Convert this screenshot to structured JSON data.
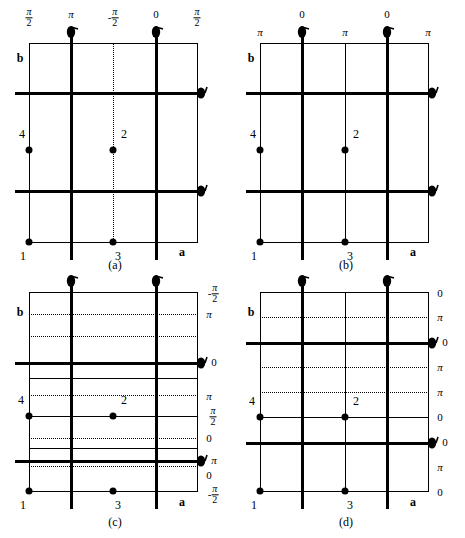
{
  "figure": {
    "type": "crystallographic-space-group-diagram",
    "panels": [
      {
        "id": "a",
        "caption": "(a)",
        "axis_a_label": "a",
        "axis_b_label": "b",
        "top_labels": [
          "π/2",
          "π",
          "-π/2",
          "0",
          "π/2"
        ],
        "top_labels_parts": [
          {
            "neg": "",
            "num": "π",
            "den": "2"
          },
          {
            "whole": "π"
          },
          {
            "neg": "-",
            "num": "π",
            "den": "2"
          },
          {
            "whole": "0"
          },
          {
            "neg": "",
            "num": "π",
            "den": "2"
          }
        ],
        "right_labels": [],
        "atoms": [
          {
            "label": "4",
            "x": 0.0,
            "y": 0.42
          },
          {
            "label": "2",
            "x": 0.5,
            "y": 0.42
          },
          {
            "label": "1",
            "x": 0.0,
            "y": 0.0
          },
          {
            "label": "3",
            "x": 0.5,
            "y": 0.0
          }
        ],
        "horizontal_dotted": [],
        "screw_axes_top": [
          1,
          3
        ],
        "screw_axes_right": [
          2,
          2
        ]
      },
      {
        "id": "b",
        "caption": "(b)",
        "axis_a_label": "a",
        "axis_b_label": "b",
        "top_labels": [
          "π",
          "0",
          "π",
          "0",
          "π"
        ],
        "top_labels_parts": [
          {
            "whole": "π"
          },
          {
            "whole": "0"
          },
          {
            "whole": "π"
          },
          {
            "whole": "0"
          },
          {
            "whole": "π"
          }
        ],
        "right_labels": [],
        "atoms": [
          {
            "label": "4",
            "x": 0.0,
            "y": 0.42
          },
          {
            "label": "2",
            "x": 0.5,
            "y": 0.42
          },
          {
            "label": "1",
            "x": 0.0,
            "y": 0.0
          },
          {
            "label": "3",
            "x": 0.5,
            "y": 0.0
          }
        ],
        "horizontal_dotted": [],
        "screw_axes_top": [
          1,
          3
        ],
        "screw_axes_right": [
          2,
          2
        ]
      },
      {
        "id": "c",
        "caption": "(c)",
        "axis_a_label": "a",
        "axis_b_label": "b",
        "top_labels": [],
        "right_labels": [
          "-π/2",
          "π",
          "0",
          "π",
          "π/2",
          "0",
          "π",
          "0",
          "-π/2"
        ],
        "right_labels_parts": [
          {
            "neg": "-",
            "num": "π",
            "den": "2"
          },
          {
            "whole": "π"
          },
          {
            "whole": "0"
          },
          {
            "whole": "π"
          },
          {
            "neg": "",
            "num": "π",
            "den": "2"
          },
          {
            "whole": "0"
          },
          {
            "whole": "π"
          },
          {
            "whole": "0"
          },
          {
            "neg": "-",
            "num": "π",
            "den": "2"
          }
        ],
        "atoms": [
          {
            "label": "4",
            "x": 0.0,
            "y": 0.42
          },
          {
            "label": "2",
            "x": 0.5,
            "y": 0.42
          },
          {
            "label": "1",
            "x": 0.0,
            "y": 0.0
          },
          {
            "label": "3",
            "x": 0.5,
            "y": 0.0
          }
        ],
        "horizontal_dotted": [
          0.11,
          0.22,
          0.355,
          0.42,
          0.5,
          0.72,
          0.845
        ],
        "screw_axes_top": [
          1,
          3
        ],
        "screw_axes_right": [
          2,
          2
        ]
      },
      {
        "id": "d",
        "caption": "(d)",
        "axis_a_label": "a",
        "axis_b_label": "b",
        "top_labels": [],
        "right_labels": [
          "0",
          "π",
          "0",
          "π",
          "0",
          "π",
          "0",
          "π",
          "0"
        ],
        "right_labels_parts": [
          {
            "whole": "0"
          },
          {
            "whole": "π"
          },
          {
            "whole": "0"
          },
          {
            "whole": "π"
          },
          {
            "whole": "0"
          },
          {
            "whole": "π"
          },
          {
            "whole": "0"
          },
          {
            "whole": "π"
          },
          {
            "whole": "0"
          }
        ],
        "atoms": [
          {
            "label": "4",
            "x": 0.0,
            "y": 0.42
          },
          {
            "label": "2",
            "x": 0.5,
            "y": 0.42
          },
          {
            "label": "1",
            "x": 0.0,
            "y": 0.0
          },
          {
            "label": "3",
            "x": 0.5,
            "y": 0.0
          }
        ],
        "horizontal_dotted": [
          0.125,
          0.375,
          0.625,
          0.875
        ],
        "screw_axes_top": [
          1,
          3
        ],
        "screw_axes_right": [
          2,
          2
        ]
      }
    ],
    "colors": {
      "line": "#000000",
      "background": "#ffffff",
      "atom": "#000000"
    }
  }
}
